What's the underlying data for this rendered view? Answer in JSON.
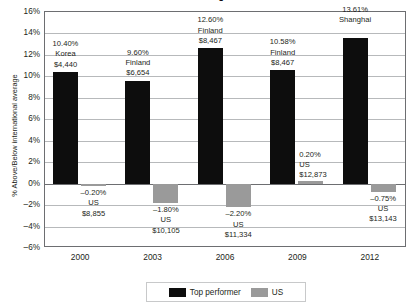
{
  "chart_data": {
    "type": "bar",
    "title": "Science: Age 15",
    "xlabel": "",
    "ylabel": "% Above/Below international average",
    "ylim": [
      -6,
      16
    ],
    "ytick_step": 2,
    "grid": true,
    "legend_position": "bottom-center",
    "categories": [
      "2000",
      "2003",
      "2006",
      "2009",
      "2012"
    ],
    "series": [
      {
        "name": "Top performer",
        "color": "#0d0d0d",
        "values": [
          10.4,
          9.6,
          12.6,
          10.58,
          13.61
        ]
      },
      {
        "name": "US",
        "color": "#9a9a9a",
        "values": [
          -0.2,
          -1.8,
          -2.2,
          0.2,
          -0.75
        ]
      }
    ],
    "yticks": [
      "16%",
      "14%",
      "12%",
      "10%",
      "8%",
      "6%",
      "4%",
      "2%",
      "0%",
      "-2%",
      "-4%",
      "-6%"
    ],
    "annotations": {
      "top_performer": [
        {
          "percent": "10.40%",
          "country": "Korea",
          "spend": "$4,440"
        },
        {
          "percent": "9.60%",
          "country": "Finland",
          "spend": "$6,654"
        },
        {
          "percent": "12.60%",
          "country": "Finland",
          "spend": "$8,467"
        },
        {
          "percent": "10.58%",
          "country": "Finland",
          "spend": "$8,467"
        },
        {
          "percent": "13.61%",
          "country": "Shanghai",
          "spend": ""
        }
      ],
      "us": [
        {
          "percent": "-0.20%",
          "country": "US",
          "spend": "$8,855"
        },
        {
          "percent": "-1.80%",
          "country": "US",
          "spend": "$10,105"
        },
        {
          "percent": "-2.20%",
          "country": "US",
          "spend": "$11,334"
        },
        {
          "percent": "0.20%",
          "country": "US",
          "spend": "$12,873"
        },
        {
          "percent": "-0.75%",
          "country": "US",
          "spend": "$13,143"
        }
      ]
    }
  },
  "legend": {
    "items": [
      {
        "label": "Top performer",
        "color": "#0d0d0d"
      },
      {
        "label": "US",
        "color": "#9a9a9a"
      }
    ]
  }
}
